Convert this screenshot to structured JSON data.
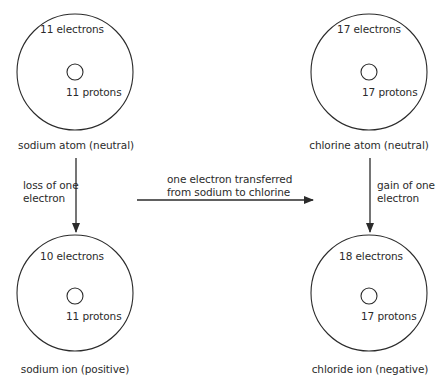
{
  "diagram": {
    "atoms": [
      {
        "id": "sodium-atom",
        "electrons": "11 electrons",
        "protons": "11 protons",
        "caption": "sodium atom (neutral)",
        "cx": 75,
        "cy": 72
      },
      {
        "id": "chlorine-atom",
        "electrons": "17 electrons",
        "protons": "17 protons",
        "caption": "chlorine atom (neutral)",
        "cx": 369,
        "cy": 72
      },
      {
        "id": "sodium-ion",
        "electrons": "10 electrons",
        "protons": "11 protons",
        "caption": "sodium ion (positive)",
        "cx": 75,
        "cy": 325
      },
      {
        "id": "chloride-ion",
        "electrons": "18 electrons",
        "protons": "17 protons",
        "caption": "chloride ion (negative)",
        "cx": 369,
        "cy": 325
      }
    ],
    "arrows": {
      "left": {
        "label_line1": "loss of one",
        "label_line2": "electron"
      },
      "middle": {
        "label_line1": "one electron transferred",
        "label_line2": "from sodium to chlorine"
      },
      "right": {
        "label_line1": "gain of one",
        "label_line2": "electron"
      }
    },
    "colors": {
      "line": "#2b2b2b",
      "text": "#2b2b2b",
      "background": "#ffffff"
    }
  }
}
